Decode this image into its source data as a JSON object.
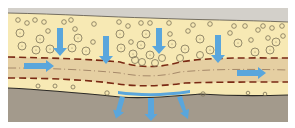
{
  "diagram": {
    "type": "soil-cross-section",
    "width": 295,
    "height": 128,
    "colors": {
      "background": "#ffffff",
      "surface_band": "#d3d0ca",
      "upper_layer": "#f7e9b4",
      "middle_band": "#e5cfa2",
      "lower_pale_band": "#f4e4b0",
      "bedrock": "#a39a8c",
      "dashed_boundary": "#7a2a14",
      "centerline": "#8a6a50",
      "bedrock_line": "#2c2a26",
      "pebble_stroke": "#7d7358",
      "arrow": "#5aa6dc"
    },
    "layers": [
      {
        "name": "surface"
      },
      {
        "name": "upper-pebble-layer"
      },
      {
        "name": "middle-band"
      },
      {
        "name": "lower-pale-layer"
      },
      {
        "name": "bedrock"
      }
    ],
    "arrows": {
      "down_upper": [
        {
          "x": 60,
          "y1": 28,
          "y2": 56
        },
        {
          "x": 106,
          "y1": 36,
          "y2": 64
        },
        {
          "x": 159,
          "y1": 28,
          "y2": 54
        },
        {
          "x": 218,
          "y1": 35,
          "y2": 63
        }
      ],
      "horizontal": [
        {
          "x1": 24,
          "x2": 54,
          "y": 66
        },
        {
          "x1": 237,
          "x2": 266,
          "y": 73
        }
      ],
      "seep_down": [
        {
          "x1": 122,
          "y1": 98,
          "x2": 116,
          "y2": 118
        },
        {
          "x1": 151,
          "y1": 100,
          "x2": 151,
          "y2": 122
        },
        {
          "x1": 180,
          "y1": 98,
          "x2": 186,
          "y2": 118
        }
      ]
    }
  }
}
